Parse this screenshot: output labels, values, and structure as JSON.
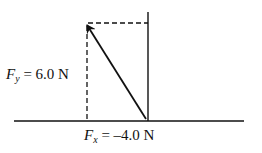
{
  "diagram": {
    "type": "force-vector-components",
    "fy_label": {
      "symbol": "F",
      "subscript": "y",
      "value_text": " = 6.0 N"
    },
    "fx_label": {
      "symbol": "F",
      "subscript": "x",
      "value_text": " = –4.0 N"
    },
    "colors": {
      "stroke": "#111111",
      "background": "#ffffff"
    }
  }
}
